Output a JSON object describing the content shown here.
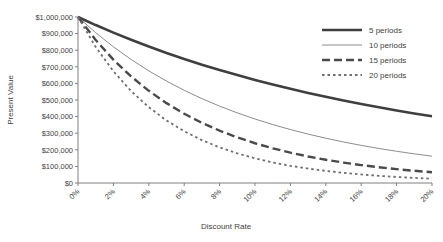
{
  "chart_data": {
    "type": "line",
    "title": "",
    "xlabel": "Discount Rate",
    "ylabel": "Present Value",
    "xlim": [
      0,
      20
    ],
    "ylim": [
      0,
      1000000
    ],
    "grid": false,
    "legend_position": "top-right",
    "x": [
      0,
      1,
      2,
      3,
      4,
      5,
      6,
      7,
      8,
      9,
      10,
      11,
      12,
      13,
      14,
      15,
      16,
      17,
      18,
      19,
      20
    ],
    "x_tick_labels": [
      "0%",
      "2%",
      "4%",
      "6%",
      "8%",
      "10%",
      "12%",
      "14%",
      "16%",
      "18%",
      "20%"
    ],
    "x_tick_values": [
      0,
      2,
      4,
      6,
      8,
      10,
      12,
      14,
      16,
      18,
      20
    ],
    "y_tick_labels": [
      "$0",
      "$100,000",
      "$200,000",
      "$300,000",
      "$400,000",
      "$500,000",
      "$600,000",
      "$700,000",
      "$800,000",
      "$900,000",
      "$1,000,000"
    ],
    "y_tick_values": [
      0,
      100000,
      200000,
      300000,
      400000,
      500000,
      600000,
      700000,
      800000,
      900000,
      1000000
    ],
    "series": [
      {
        "name": "5 periods",
        "style": "thick-solid",
        "color": "#3f3f3f",
        "values": [
          1000000,
          951466,
          905731,
          862609,
          821927,
          783526,
          747258,
          712986,
          680583,
          649931,
          620921,
          593451,
          567427,
          542760,
          519369,
          497177,
          476113,
          456111,
          437109,
          419049,
          401878
        ]
      },
      {
        "name": "10 periods",
        "style": "thin-solid",
        "color": "#8c8c8c",
        "values": [
          1000000,
          905287,
          820348,
          744094,
          675564,
          613913,
          558395,
          508349,
          463193,
          422411,
          385543,
          352184,
          321973,
          294588,
          269744,
          247185,
          226684,
          208037,
          191064,
          175602,
          161506
        ]
      },
      {
        "name": "15 periods",
        "style": "thick-dashed",
        "color": "#4a4a4a",
        "values": [
          1000000,
          861349,
          743015,
          641862,
          555265,
          481017,
          417265,
          362446,
          315242,
          274538,
          239392,
          209004,
          182696,
          159891,
          140096,
          122894,
          107927,
          94890,
          83516,
          73580,
          64905
        ]
      },
      {
        "name": "20 periods",
        "style": "dotted",
        "color": "#6e6e6e",
        "values": [
          1000000,
          819544,
          672971,
          553676,
          456387,
          376889,
          311805,
          258419,
          214548,
          178431,
          148644,
          124034,
          103667,
          86782,
          72762,
          61100,
          51385,
          43280,
          36506,
          30832,
          26084
        ]
      }
    ]
  },
  "legend": {
    "items": [
      {
        "label": "5 periods"
      },
      {
        "label": "10 periods"
      },
      {
        "label": "15 periods"
      },
      {
        "label": "20 periods"
      }
    ]
  }
}
